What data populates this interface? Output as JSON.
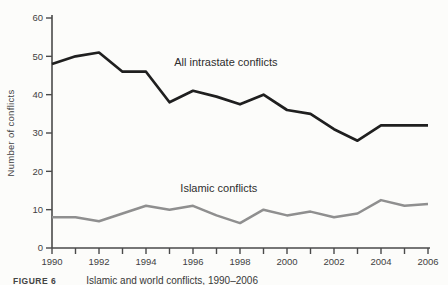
{
  "figure": {
    "caption_label": "FIGURE 6",
    "caption_text": "Islamic and world conflicts, 1990–2006"
  },
  "chart_data": {
    "type": "line",
    "title": "",
    "xlabel": "",
    "ylabel": "Number of conflicts",
    "x": [
      1990,
      1991,
      1992,
      1993,
      1994,
      1995,
      1996,
      1997,
      1998,
      1999,
      2000,
      2001,
      2002,
      2003,
      2004,
      2005,
      2006
    ],
    "x_tick_labels": [
      "1990",
      "1992",
      "1994",
      "1996",
      "1998",
      "2000",
      "2002",
      "2004",
      "2006"
    ],
    "y_ticks": [
      0,
      10,
      20,
      30,
      40,
      50,
      60
    ],
    "ylim": [
      0,
      60
    ],
    "xlim": [
      1990,
      2006
    ],
    "grid": false,
    "legend": "inline-labels",
    "series": [
      {
        "name": "All intrastate conflicts",
        "color": "#1f1f1f",
        "width": 2.7,
        "values": [
          48,
          50,
          51,
          46,
          46,
          38,
          41,
          39.5,
          37.5,
          40,
          36,
          35,
          31,
          28,
          32,
          32,
          32
        ]
      },
      {
        "name": "Islamic conflicts",
        "color": "#8f8f8f",
        "width": 2.5,
        "values": [
          8,
          8,
          7,
          9,
          11,
          10,
          11,
          8.5,
          6.5,
          10,
          8.5,
          9.5,
          8,
          9,
          12.5,
          11,
          11.5
        ]
      }
    ],
    "annotations": [
      {
        "text": "All intrastate conflicts",
        "x": 1997.4,
        "y": 47.5,
        "series": 0
      },
      {
        "text": "Islamic conflicts",
        "x": 1997.1,
        "y": 14.7,
        "series": 1
      }
    ],
    "colors": {
      "axis": "#4a4a4a",
      "tick_text": "#3f3f3f",
      "annotation_text": "#2e2e2e",
      "background": "#fcfcfa"
    }
  }
}
